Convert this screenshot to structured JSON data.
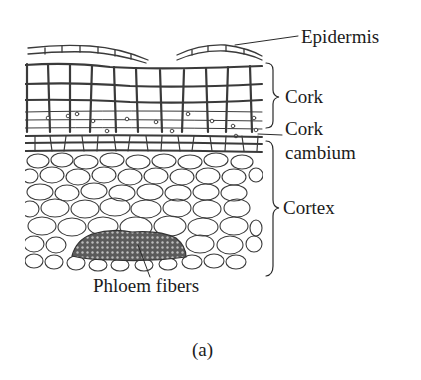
{
  "figure": {
    "caption": "(a)"
  },
  "labels": {
    "epidermis": "Epidermis",
    "cork": "Cork",
    "cork_cambium_line1": "Cork",
    "cork_cambium_line2": "cambium",
    "cortex": "Cortex",
    "phloem_fibers": "Phloem fibers"
  },
  "layers": [
    {
      "name": "Epidermis",
      "indicator": "leader-line"
    },
    {
      "name": "Cork",
      "indicator": "brace"
    },
    {
      "name": "Cork cambium",
      "indicator": "leader-line"
    },
    {
      "name": "Cortex",
      "indicator": "brace"
    },
    {
      "name": "Phloem fibers",
      "indicator": "leader-line"
    }
  ],
  "colors": {
    "ink": "#3a3a3a",
    "fiber_fill": "#555555",
    "background": "#ffffff"
  }
}
